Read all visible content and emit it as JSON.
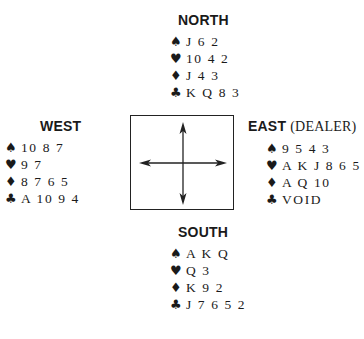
{
  "north": {
    "title": "NORTH",
    "spades": "J 6 2",
    "hearts": "10 4 2",
    "diamonds": "J 4 3",
    "clubs": "K Q 8 3"
  },
  "west": {
    "title": "WEST",
    "spades": "10 8 7",
    "hearts": "9 7",
    "diamonds": "8 7 6 5",
    "clubs": "A 10 9 4"
  },
  "east": {
    "title": "EAST",
    "subtitle": "(DEALER)",
    "spades": "9 5 4 3",
    "hearts": "A K J 8 6 5",
    "diamonds": "A Q 10",
    "clubs": "VOID"
  },
  "south": {
    "title": "SOUTH",
    "spades": "A K Q",
    "hearts": "Q 3",
    "diamonds": "K 9 2",
    "clubs": "J 7 6 5 2"
  },
  "icons": {
    "spade": "♠",
    "heart": "♥",
    "diamond": "♦",
    "club": "♣"
  }
}
